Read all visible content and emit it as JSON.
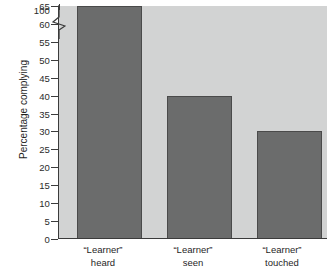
{
  "chart_data": {
    "type": "bar",
    "title": "",
    "subtitle": "",
    "xlabel": "",
    "ylabel": "Percentage complying",
    "categories": [
      "“Learner” heard",
      "“Learner” seen",
      "“Learner” touched"
    ],
    "category_lines": [
      {
        "line1": "“Learner”",
        "line2": "heard"
      },
      {
        "line1": "“Learner”",
        "line2": "seen"
      },
      {
        "line1": "“Learner”",
        "line2": "touched"
      }
    ],
    "values": [
      65,
      40,
      30
    ],
    "ylim": [
      0,
      65
    ],
    "y_ticks": [
      0,
      5,
      10,
      15,
      20,
      25,
      30,
      35,
      40,
      45,
      50,
      55,
      60,
      65
    ],
    "y_tick_labels": [
      "0",
      "5",
      "10",
      "15",
      "20",
      "25",
      "30",
      "35",
      "40",
      "45",
      "50",
      "55",
      "60",
      "65"
    ],
    "y_axis_top_label": "100",
    "axis_break": true,
    "grid": false,
    "legend": false,
    "bar_color": "#6b6c6c",
    "bar_edge_color": "#4a4a4a",
    "plot_background": "#d2d3d3",
    "axis_color": "#3b3b3b",
    "text_color": "#1f1f1f"
  }
}
